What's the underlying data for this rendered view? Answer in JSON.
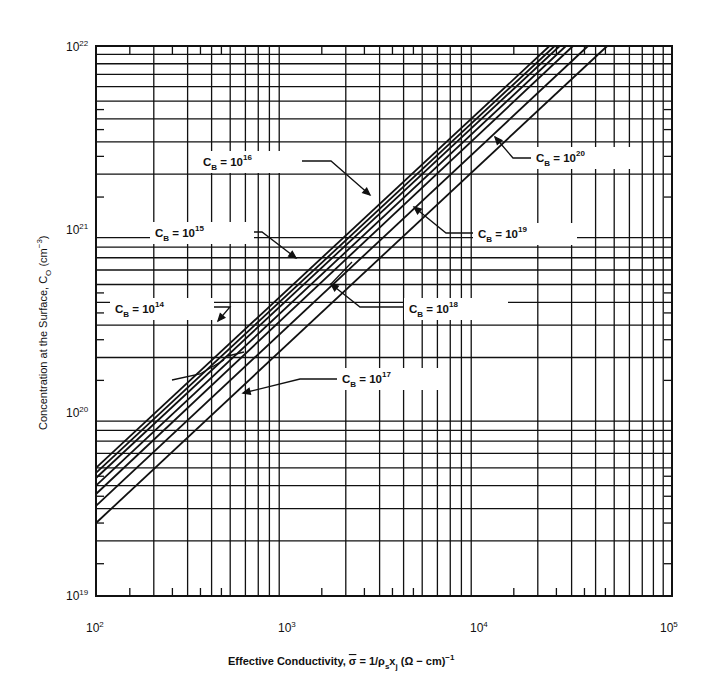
{
  "chart_data": {
    "type": "line",
    "title": "",
    "xlabel": "Effective Conductivity, σ̄ = 1/ρs xj (Ω − cm)^−1",
    "ylabel": "Concentration at the Surface, CO (cm^−3)",
    "xscale": "log",
    "yscale": "log",
    "xlim": [
      100,
      100000
    ],
    "ylim": [
      1e+19,
      1e+22
    ],
    "grid": true,
    "x_ticks": [
      "10^2",
      "10^3",
      "10^4",
      "10^5"
    ],
    "y_ticks": [
      "10^19",
      "10^20",
      "10^21",
      "10^22"
    ],
    "legend_position": "inline annotations with leader arrows",
    "series": [
      {
        "name": "CB = 10^14",
        "points": [
          [
            100,
            5e+19
          ],
          [
            23000,
            1e+22
          ]
        ]
      },
      {
        "name": "CB = 10^15",
        "points": [
          [
            100,
            4.7e+19
          ],
          [
            24500,
            1e+22
          ]
        ]
      },
      {
        "name": "CB = 10^16",
        "points": [
          [
            100,
            4.4e+19
          ],
          [
            26000,
            1e+22
          ]
        ]
      },
      {
        "name": "CB = 10^17",
        "points": [
          [
            100,
            4e+19
          ],
          [
            28000,
            1e+22
          ]
        ]
      },
      {
        "name": "CB = 10^18",
        "points": [
          [
            100,
            3.6e+19
          ],
          [
            30500,
            1e+22
          ]
        ]
      },
      {
        "name": "CB = 10^19",
        "points": [
          [
            100,
            3.1e+19
          ],
          [
            36500,
            1e+22
          ]
        ]
      },
      {
        "name": "CB = 10^20",
        "points": [
          [
            100,
            2.5e+19
          ],
          [
            46000,
            1e+22
          ]
        ]
      }
    ],
    "annotations": [
      {
        "label": "CB = 10^14",
        "base": "C",
        "sub": "B",
        "exp": "14"
      },
      {
        "label": "CB = 10^15",
        "base": "C",
        "sub": "B",
        "exp": "15"
      },
      {
        "label": "CB = 10^16",
        "base": "C",
        "sub": "B",
        "exp": "16"
      },
      {
        "label": "CB = 10^17",
        "base": "C",
        "sub": "B",
        "exp": "17"
      },
      {
        "label": "CB = 10^18",
        "base": "C",
        "sub": "B",
        "exp": "18"
      },
      {
        "label": "CB = 10^19",
        "base": "C",
        "sub": "B",
        "exp": "19"
      },
      {
        "label": "CB = 10^20",
        "base": "C",
        "sub": "B",
        "exp": "20"
      }
    ]
  },
  "axes": {
    "x": {
      "title_prefix": "Effective Conductivity, ",
      "sigma": "σ",
      "title_mid": " = 1/ρ",
      "sub_s": "s",
      "x": "x",
      "sub_j": "j",
      "units": " (Ω − cm)",
      "units_exp": "−1",
      "ticks": [
        {
          "base": "10",
          "exp": "2"
        },
        {
          "base": "10",
          "exp": "3"
        },
        {
          "base": "10",
          "exp": "4"
        },
        {
          "base": "10",
          "exp": "5"
        }
      ]
    },
    "y": {
      "title_prefix": "Concentration at the Surface, C",
      "sub_o": "O",
      "units": " (cm",
      "units_exp": "−3",
      "units_close": ")",
      "ticks": [
        {
          "base": "10",
          "exp": "19"
        },
        {
          "base": "10",
          "exp": "20"
        },
        {
          "base": "10",
          "exp": "21"
        },
        {
          "base": "10",
          "exp": "22"
        }
      ]
    }
  },
  "labels": {
    "eq": " = 10",
    "c": "C",
    "b": "B"
  }
}
